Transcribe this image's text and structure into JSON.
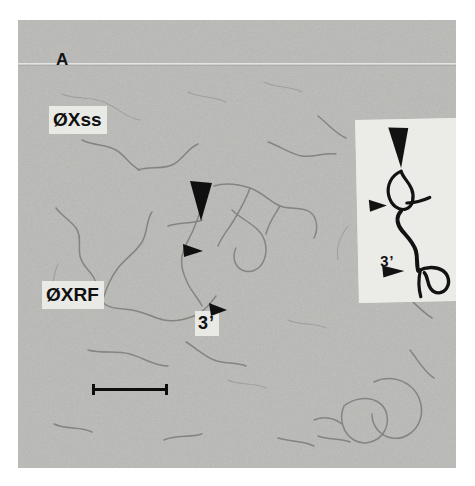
{
  "figure": {
    "panel_letter": "A",
    "type": "electron-micrograph",
    "background_color": "#b9b9b7",
    "plate_bounds": {
      "left": 18,
      "top": 20,
      "width": 438,
      "height": 448
    }
  },
  "plate_labels": {
    "single_strand": "ØXss",
    "replicative_form": "ØXRF",
    "three_prime": "3’"
  },
  "annotations": {
    "large_arrowhead": "large-arrowhead",
    "small_arrowhead_upper": "small-arrowhead",
    "small_arrowhead_lower": "small-arrowhead"
  },
  "scale_bar": {
    "name": "scale-bar",
    "color": "#0d0d0d"
  },
  "inset": {
    "name": "schematic-tracing-inset",
    "background_color": "#ebebe8",
    "three_prime_label": "3’",
    "large_arrowhead": "large-arrowhead",
    "small_arrowhead_loop": "small-arrowhead",
    "small_arrowhead_three_prime": "small-arrowhead"
  }
}
